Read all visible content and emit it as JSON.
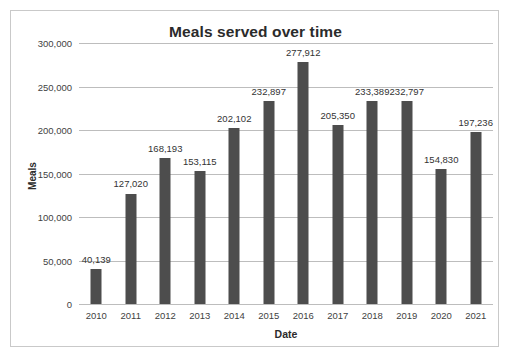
{
  "chart_data": {
    "type": "bar",
    "title": "Meals served over time",
    "xlabel": "Date",
    "ylabel": "Meals",
    "categories": [
      "2010",
      "2011",
      "2012",
      "2013",
      "2014",
      "2015",
      "2016",
      "2017",
      "2018",
      "2019",
      "2020",
      "2021"
    ],
    "values": [
      40139,
      127020,
      168193,
      153115,
      202102,
      232897,
      277912,
      205350,
      233389,
      232797,
      154830,
      197236
    ],
    "value_labels": [
      "40,139",
      "127,020",
      "168,193",
      "153,115",
      "202,102",
      "232,897",
      "277,912",
      "205,350",
      "233,389",
      "232,797",
      "154,830",
      "197,236"
    ],
    "ylim": [
      0,
      300000
    ],
    "ytick_values": [
      0,
      50000,
      100000,
      150000,
      200000,
      250000,
      300000
    ],
    "ytick_labels": [
      "0",
      "50,000",
      "100,000",
      "150,000",
      "200,000",
      "250,000",
      "300,000"
    ],
    "grid": true,
    "legend": false,
    "bar_color": "#4d4d4d",
    "gridline_color": "#bdbdbd",
    "text_color": "#333333",
    "frame_border_color": "#c9c9c9"
  }
}
